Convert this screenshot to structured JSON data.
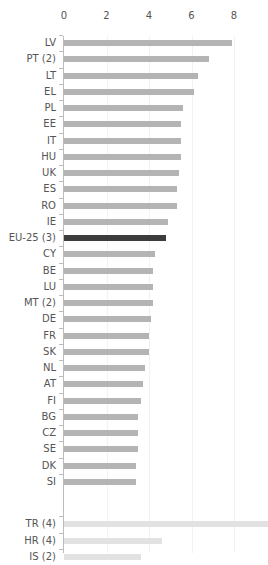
{
  "chart_data": {
    "type": "bar",
    "orientation": "horizontal",
    "title": "",
    "xlabel": "",
    "ylabel": "",
    "xlim": [
      0,
      9.5
    ],
    "x_ticks": [
      "0",
      "2",
      "4",
      "6",
      "8"
    ],
    "grid": true,
    "legend": null,
    "categories": [
      "LV",
      "PT (2)",
      "LT",
      "EL",
      "PL",
      "EE",
      "IT",
      "HU",
      "UK",
      "ES",
      "RO",
      "IE",
      "EU-25 (3)",
      "CY",
      "BE",
      "LU",
      "MT (2)",
      "DE",
      "FR",
      "SK",
      "NL",
      "AT",
      "FI",
      "BG",
      "CZ",
      "SE",
      "DK",
      "SI",
      "TR (4)",
      "HR (4)",
      "IS (2)"
    ],
    "values": [
      7.9,
      6.8,
      6.3,
      6.1,
      5.6,
      5.5,
      5.5,
      5.5,
      5.4,
      5.3,
      5.3,
      4.9,
      4.8,
      4.3,
      4.2,
      4.2,
      4.2,
      4.1,
      4.0,
      4.0,
      3.8,
      3.7,
      3.6,
      3.5,
      3.5,
      3.5,
      3.4,
      3.4,
      9.6,
      4.6,
      3.6
    ],
    "groups": [
      "eu",
      "eu",
      "eu",
      "eu",
      "eu",
      "eu",
      "eu",
      "eu",
      "eu",
      "eu",
      "eu",
      "eu",
      "aggregate",
      "eu",
      "eu",
      "eu",
      "eu",
      "eu",
      "eu",
      "eu",
      "eu",
      "eu",
      "eu",
      "eu",
      "eu",
      "eu",
      "eu",
      "eu",
      "other",
      "other",
      "other"
    ],
    "colors": {
      "eu": "#b4b4b4",
      "aggregate": "#3c3c3c",
      "other": "#e2e2e2"
    }
  }
}
